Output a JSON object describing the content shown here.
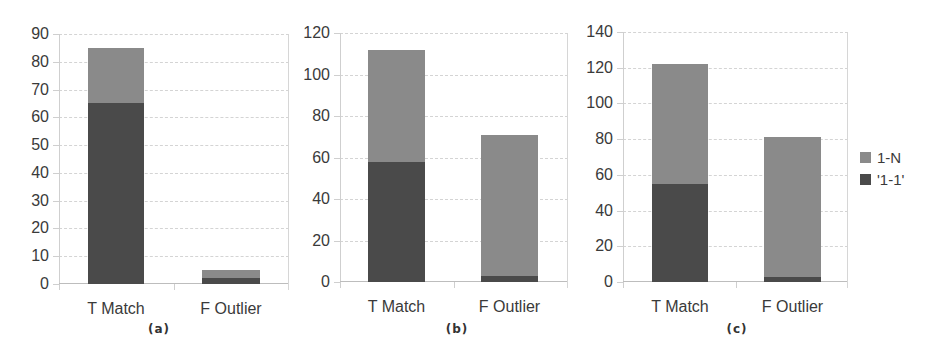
{
  "chart_data": [
    {
      "type": "bar",
      "stacked": true,
      "caption": "(a)",
      "categories": [
        "T Match",
        "F Outlier"
      ],
      "series": [
        {
          "name": "'1-1'",
          "values": [
            65,
            2
          ]
        },
        {
          "name": "1-N",
          "values": [
            20,
            3
          ]
        }
      ],
      "totals": [
        85,
        5
      ],
      "ylim": [
        0,
        90
      ],
      "yticks": [
        0,
        10,
        20,
        30,
        40,
        50,
        60,
        70,
        80,
        90
      ],
      "grid": true
    },
    {
      "type": "bar",
      "stacked": true,
      "caption": "(b)",
      "categories": [
        "T Match",
        "F Outlier"
      ],
      "series": [
        {
          "name": "'1-1'",
          "values": [
            58,
            3
          ]
        },
        {
          "name": "1-N",
          "values": [
            54,
            68
          ]
        }
      ],
      "totals": [
        112,
        71
      ],
      "ylim": [
        0,
        120
      ],
      "yticks": [
        0,
        20,
        40,
        60,
        80,
        100,
        120
      ],
      "grid": true
    },
    {
      "type": "bar",
      "stacked": true,
      "caption": "(c)",
      "categories": [
        "T Match",
        "F Outlier"
      ],
      "series": [
        {
          "name": "'1-1'",
          "values": [
            55,
            3
          ]
        },
        {
          "name": "1-N",
          "values": [
            67,
            78
          ]
        }
      ],
      "totals": [
        122,
        81
      ],
      "ylim": [
        0,
        140
      ],
      "yticks": [
        0,
        20,
        40,
        60,
        80,
        100,
        120,
        140
      ],
      "grid": true
    }
  ],
  "legend": {
    "position": "right",
    "items": [
      {
        "label": "1-N",
        "color": "#8a8a8a"
      },
      {
        "label": "'1-1'",
        "color": "#4a4a4a"
      }
    ]
  },
  "colors": {
    "one_to_n": "#8a8a8a",
    "one_to_one": "#4a4a4a"
  }
}
